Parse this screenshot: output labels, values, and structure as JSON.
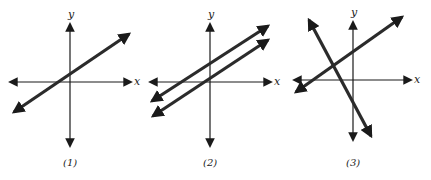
{
  "figure": {
    "axis_labels": {
      "x": "x",
      "y": "y"
    },
    "colors": {
      "axis": "#1a1a1a",
      "line": "#2b2b2b",
      "background": "#ffffff"
    },
    "panels": [
      {
        "caption": "(1)",
        "case": "single line (coincident lines)",
        "origin": [
          70,
          82
        ],
        "x_axis": [
          10,
          131
        ],
        "y_axis": [
          24,
          146
        ],
        "lines": [
          {
            "from": [
              14,
              112
            ],
            "to": [
              129,
              34
            ]
          }
        ]
      },
      {
        "caption": "(2)",
        "case": "parallel lines",
        "origin": [
          210,
          82
        ],
        "x_axis": [
          150,
          271
        ],
        "y_axis": [
          24,
          146
        ],
        "lines": [
          {
            "from": [
              152,
              101
            ],
            "to": [
              268,
              26
            ]
          },
          {
            "from": [
              153,
              116
            ],
            "to": [
              268,
              40
            ]
          }
        ]
      },
      {
        "caption": "(3)",
        "case": "intersecting lines",
        "origin": [
          353,
          80
        ],
        "x_axis": [
          294,
          411
        ],
        "y_axis": [
          22,
          140
        ],
        "lines": [
          {
            "from": [
              296,
              92
            ],
            "to": [
              402,
              17
            ]
          },
          {
            "from": [
              309,
              20
            ],
            "to": [
              371,
              136
            ]
          }
        ]
      }
    ]
  }
}
